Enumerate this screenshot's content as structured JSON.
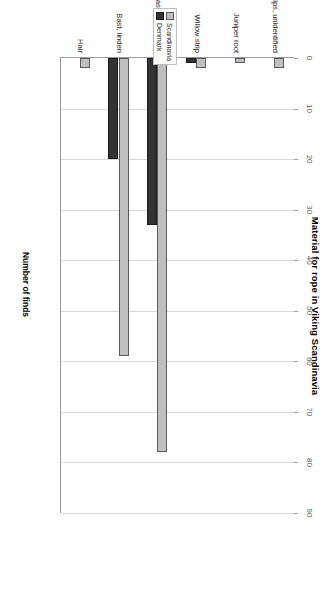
{
  "chart_data": {
    "type": "bar",
    "title": "Material for rope in Viking Scandinavia",
    "xlabel": "",
    "ylabel": "Number of finds",
    "orientation": "vertical-bars-rotated-90",
    "categories": [
      "Wood strips, unidentified",
      "Juniper root",
      "Willow strip",
      "Bast, unidentified",
      "Bast, linden",
      "Hair"
    ],
    "series": [
      {
        "name": "Scandinavia",
        "color": "#bfbfbf",
        "values": [
          2,
          1,
          2,
          78,
          59,
          2
        ]
      },
      {
        "name": "Denmark",
        "color": "#333333",
        "values": [
          0,
          0,
          1,
          33,
          20,
          0
        ]
      }
    ],
    "ylim": [
      0,
      90
    ],
    "ticks": [
      0,
      10,
      20,
      30,
      40,
      50,
      60,
      70,
      80,
      90
    ],
    "tick_labels": [
      "0",
      "10",
      "20",
      "30",
      "40",
      "50",
      "60",
      "70",
      "80",
      "90"
    ],
    "grid": true,
    "legend_position": "left-middle"
  },
  "legend": {
    "entries": [
      {
        "label": "Scandinavia"
      },
      {
        "label": "Denmark"
      }
    ]
  }
}
